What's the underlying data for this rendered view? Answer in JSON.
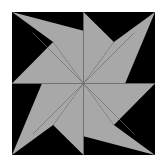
{
  "canvas": {
    "width": 164,
    "height": 165,
    "background_color": "#ffffff",
    "title": "Eight Point Star Quilt Block"
  },
  "block": {
    "name": "eight-point-star",
    "x": 12,
    "y": 12,
    "width": 143,
    "height": 143,
    "background_color": "#000000",
    "center_x": 83.5,
    "center_y": 83.5
  },
  "star": {
    "points": 8,
    "fill_color": "#a8a8a8",
    "seam_color": "#6e6e6e",
    "seam_width": 0.7,
    "tip_labels": [
      "north",
      "northeast",
      "east",
      "southeast",
      "south",
      "southwest",
      "west",
      "northwest"
    ],
    "tips": [
      {
        "label": "north",
        "x": 83.5,
        "y": 12.0
      },
      {
        "label": "northeast",
        "x": 155.0,
        "y": 12.0
      },
      {
        "label": "east",
        "x": 155.0,
        "y": 83.5
      },
      {
        "label": "southeast",
        "x": 155.0,
        "y": 155.0
      },
      {
        "label": "south",
        "x": 83.5,
        "y": 155.0
      },
      {
        "label": "southwest",
        "x": 12.0,
        "y": 155.0
      },
      {
        "label": "west",
        "x": 12.0,
        "y": 83.5
      },
      {
        "label": "northwest",
        "x": 12.0,
        "y": 12.0
      }
    ],
    "valleys": [
      {
        "label": "valley-nne",
        "x": 113.9,
        "y": 41.9
      },
      {
        "label": "valley-ene",
        "x": 125.1,
        "y": 83.5
      },
      {
        "label": "valley-ese",
        "x": 113.9,
        "y": 125.1
      },
      {
        "label": "valley-sse",
        "x": 83.5,
        "y": 136.3
      },
      {
        "label": "valley-ssw",
        "x": 53.1,
        "y": 125.1
      },
      {
        "label": "valley-wsw",
        "x": 41.9,
        "y": 83.5
      },
      {
        "label": "valley-wnw",
        "x": 53.1,
        "y": 41.9
      },
      {
        "label": "valley-nnw",
        "x": 83.5,
        "y": 30.7
      }
    ],
    "wedge_paths": [
      "M83.5,83.5 L83.5,30.7 L83.5,12 L113.9,41.9 Z",
      "M83.5,83.5 L113.9,41.9 L155,12 L125.1,83.5 Z",
      "M83.5,83.5 L125.1,83.5 L155,83.5 L113.9,125.1 Z",
      "M83.5,83.5 L113.9,125.1 L155,155 L83.5,136.3 Z",
      "M83.5,83.5 L83.5,136.3 L83.5,155 L53.1,125.1 Z",
      "M83.5,83.5 L53.1,125.1 L12,155 L41.9,83.5 Z",
      "M83.5,83.5 L41.9,83.5 L12,83.5 L53.1,41.9 Z",
      "M83.5,83.5 L53.1,41.9 L12,12 L83.5,30.7 Z"
    ],
    "star_outline": "M83.5,12 L113.9,41.9 L155,12 L125.1,83.5 L155,83.5 L113.9,125.1 L155,155 L83.5,136.3 L83.5,155 L53.1,125.1 L12,155 L41.9,83.5 L12,83.5 L53.1,41.9 L12,12 L83.5,30.7 Z",
    "seam_lines": [
      {
        "label": "seam-vertical-up",
        "x1": 83.5,
        "y1": 83.5,
        "x2": 83.5,
        "y2": 12.0
      },
      {
        "label": "seam-diagonal-ne",
        "x1": 83.5,
        "y1": 83.5,
        "x2": 134.1,
        "y2": 32.9
      },
      {
        "label": "seam-horizontal-e",
        "x1": 83.5,
        "y1": 83.5,
        "x2": 155.0,
        "y2": 83.5
      },
      {
        "label": "seam-diagonal-se",
        "x1": 83.5,
        "y1": 83.5,
        "x2": 134.1,
        "y2": 134.1
      },
      {
        "label": "seam-vertical-down",
        "x1": 83.5,
        "y1": 83.5,
        "x2": 83.5,
        "y2": 155.0
      },
      {
        "label": "seam-diagonal-sw",
        "x1": 83.5,
        "y1": 83.5,
        "x2": 32.9,
        "y2": 134.1
      },
      {
        "label": "seam-horizontal-w",
        "x1": 83.5,
        "y1": 83.5,
        "x2": 12.0,
        "y2": 83.5
      },
      {
        "label": "seam-diagonal-nw",
        "x1": 83.5,
        "y1": 83.5,
        "x2": 32.9,
        "y2": 32.9
      }
    ]
  },
  "corners": [
    {
      "label": "corner-top-left",
      "path": "M12,12 L53.1,41.9 L12,83.5 Z"
    },
    {
      "label": "corner-top-right",
      "path": "M155,12 L113.9,41.9 L155,83.5 Z"
    },
    {
      "label": "corner-bottom-right",
      "path": "M155,155 L113.9,125.1 L155,83.5 Z"
    },
    {
      "label": "corner-bottom-left",
      "path": "M12,155 L53.1,125.1 L12,83.5 Z"
    }
  ]
}
